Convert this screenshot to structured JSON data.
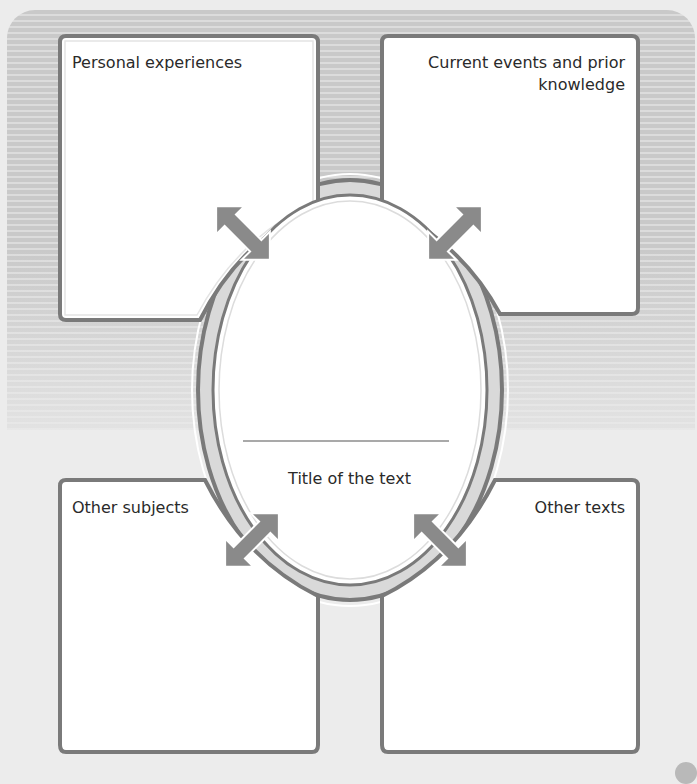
{
  "diagram": {
    "type": "graphic-organizer",
    "center": {
      "label": "Title of the text",
      "answer_line": ""
    },
    "boxes": [
      {
        "id": "top-left",
        "label": "Personal experiences",
        "content": ""
      },
      {
        "id": "top-right",
        "label": "Current events and prior knowledge",
        "label_line1": "Current events and prior",
        "label_line2": "knowledge",
        "content": ""
      },
      {
        "id": "bottom-left",
        "label": "Other subjects",
        "content": ""
      },
      {
        "id": "bottom-right",
        "label": "Other texts",
        "content": ""
      }
    ],
    "connectors": "double-headed arrows linking each box to center oval",
    "colors": {
      "box_border": "#7a7a7a",
      "arrow": "#8a8a8a",
      "ring": "#d6d6d6",
      "background_stripes": "#c9c9c9",
      "box_fill": "#ffffff"
    }
  }
}
